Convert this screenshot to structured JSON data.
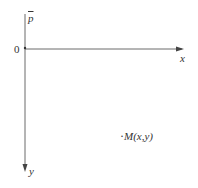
{
  "diagram": {
    "origin_label": "0",
    "x_axis_label": "x",
    "y_axis_label": "y",
    "vector_label": "p",
    "point_label": "M(x,y)",
    "point_bullet": "·",
    "colors": {
      "axis": "#6b6b6b",
      "text": "#333333",
      "background": "#ffffff"
    }
  }
}
